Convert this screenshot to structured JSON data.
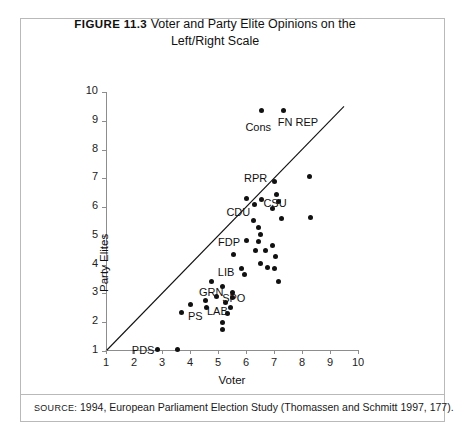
{
  "figure": {
    "number": "FIGURE 11.3",
    "title_line1": "Voter and Party Elite Opinions on the",
    "title_line2": "Left/Right Scale"
  },
  "source": {
    "prefix": "SOURCE:",
    "text": "1994, European Parliament Election Study (Thomassen and Schmitt 1997, 177)."
  },
  "colors": {
    "point": "#111111",
    "axis": "#8d8d8d",
    "border": "#b9b9b9",
    "text": "#1a1a1a"
  },
  "chart_data": {
    "type": "scatter",
    "title": "Voter and Party Elite Opinions on the Left/Right Scale",
    "xlabel": "Voter",
    "ylabel": "Party Elites",
    "xlim": [
      1,
      10
    ],
    "ylim": [
      1,
      10
    ],
    "xticks": [
      1,
      2,
      3,
      4,
      5,
      6,
      7,
      8,
      9,
      10
    ],
    "yticks": [
      1,
      2,
      3,
      4,
      5,
      6,
      7,
      8,
      9,
      10
    ],
    "grid": false,
    "legend": "none",
    "reference_line": {
      "name": "45-degree diagonal",
      "from": [
        1,
        1
      ],
      "to": [
        9.5,
        9.5
      ]
    },
    "points": [
      {
        "x": 6.55,
        "y": 9.35,
        "label": "Cons",
        "label_dx": -16,
        "label_dy": 16
      },
      {
        "x": 7.35,
        "y": 9.35,
        "label": "FN REP",
        "label_dx": -6,
        "label_dy": 11
      },
      {
        "x": 8.25,
        "y": 7.05,
        "label": ""
      },
      {
        "x": 7.0,
        "y": 6.9,
        "label": "RPR",
        "label_dx": -30,
        "label_dy": -3
      },
      {
        "x": 7.1,
        "y": 6.45,
        "label": ""
      },
      {
        "x": 6.0,
        "y": 6.3,
        "label": ""
      },
      {
        "x": 6.55,
        "y": 6.25,
        "label": "CSU",
        "label_dx": 2,
        "label_dy": 3
      },
      {
        "x": 7.15,
        "y": 6.2,
        "label": ""
      },
      {
        "x": 6.3,
        "y": 6.1,
        "label": "CDU",
        "label_dx": -28,
        "label_dy": 8
      },
      {
        "x": 6.95,
        "y": 5.95,
        "label": ""
      },
      {
        "x": 8.3,
        "y": 5.65,
        "label": ""
      },
      {
        "x": 7.25,
        "y": 5.6,
        "label": ""
      },
      {
        "x": 6.25,
        "y": 5.55,
        "label": ""
      },
      {
        "x": 6.45,
        "y": 5.3,
        "label": ""
      },
      {
        "x": 6.5,
        "y": 5.05,
        "label": ""
      },
      {
        "x": 6.0,
        "y": 4.85,
        "label": "FDP",
        "label_dx": -28,
        "label_dy": 2
      },
      {
        "x": 6.45,
        "y": 4.8,
        "label": ""
      },
      {
        "x": 6.95,
        "y": 4.65,
        "label": ""
      },
      {
        "x": 6.35,
        "y": 4.5,
        "label": ""
      },
      {
        "x": 6.7,
        "y": 4.5,
        "label": ""
      },
      {
        "x": 7.05,
        "y": 4.3,
        "label": ""
      },
      {
        "x": 5.55,
        "y": 4.35,
        "label": ""
      },
      {
        "x": 6.5,
        "y": 4.05,
        "label": ""
      },
      {
        "x": 6.75,
        "y": 3.9,
        "label": ""
      },
      {
        "x": 7.0,
        "y": 3.85,
        "label": ""
      },
      {
        "x": 5.85,
        "y": 3.85,
        "label": "LIB",
        "label_dx": -24,
        "label_dy": 3
      },
      {
        "x": 5.95,
        "y": 3.65,
        "label": ""
      },
      {
        "x": 7.15,
        "y": 3.4,
        "label": ""
      },
      {
        "x": 4.75,
        "y": 3.4,
        "label": "GRN",
        "label_dx": -12,
        "label_dy": 10
      },
      {
        "x": 5.15,
        "y": 3.25,
        "label": "SPO",
        "label_dx": 0,
        "label_dy": 12
      },
      {
        "x": 5.5,
        "y": 3.05,
        "label": ""
      },
      {
        "x": 4.95,
        "y": 2.9,
        "label": ""
      },
      {
        "x": 5.5,
        "y": 2.85,
        "label": ""
      },
      {
        "x": 4.55,
        "y": 2.75,
        "label": ""
      },
      {
        "x": 5.25,
        "y": 2.7,
        "label": "LAB",
        "label_dx": -18,
        "label_dy": 9
      },
      {
        "x": 4.0,
        "y": 2.6,
        "label": "PS",
        "label_dx": -2,
        "label_dy": 11
      },
      {
        "x": 4.6,
        "y": 2.5,
        "label": ""
      },
      {
        "x": 5.45,
        "y": 2.5,
        "label": ""
      },
      {
        "x": 5.35,
        "y": 2.3,
        "label": ""
      },
      {
        "x": 3.7,
        "y": 2.35,
        "label": ""
      },
      {
        "x": 5.15,
        "y": 2.0,
        "label": ""
      },
      {
        "x": 5.15,
        "y": 1.75,
        "label": ""
      },
      {
        "x": 2.85,
        "y": 1.05,
        "label": "PDS",
        "label_dx": -26,
        "label_dy": 0
      },
      {
        "x": 3.55,
        "y": 1.05,
        "label": ""
      }
    ]
  }
}
